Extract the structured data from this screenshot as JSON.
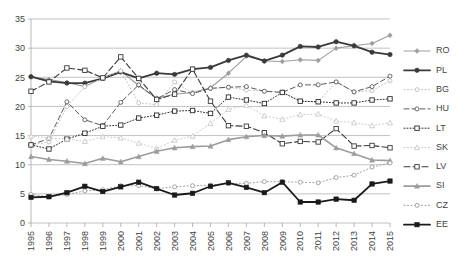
{
  "chart_data": {
    "type": "line",
    "title": "",
    "subtitle": "",
    "xlabel": "",
    "ylabel": "",
    "x": [
      1995,
      1996,
      1997,
      1998,
      1999,
      2000,
      2001,
      2002,
      2003,
      2004,
      2005,
      2006,
      2007,
      2008,
      2009,
      2010,
      2011,
      2012,
      2013,
      2014,
      2015
    ],
    "xlim": [
      1995,
      2015
    ],
    "ylim": [
      0,
      35
    ],
    "yticks": [
      0,
      5,
      10,
      15,
      20,
      25,
      30,
      35
    ],
    "grid": true,
    "legend_position": "right",
    "series": [
      {
        "name": "RO",
        "color": "#9c9c9c",
        "marker": "diamond",
        "dash": "none",
        "width": 1.1,
        "values": [
          25.1,
          24.6,
          24.1,
          23.4,
          24.9,
          26.1,
          23.6,
          21.4,
          22.1,
          22.4,
          23.2,
          25.7,
          28.6,
          27.8,
          27.7,
          28.0,
          27.9,
          30.0,
          30.4,
          30.8,
          32.2
        ]
      },
      {
        "name": "PL",
        "color": "#3a3a3a",
        "marker": "circle-filled",
        "dash": "none",
        "width": 1.8,
        "values": [
          25.1,
          24.3,
          24.0,
          24.0,
          24.8,
          25.9,
          24.8,
          25.7,
          25.5,
          26.4,
          26.7,
          27.9,
          28.8,
          27.8,
          28.8,
          30.3,
          30.2,
          31.1,
          30.4,
          29.3,
          28.9
        ]
      },
      {
        "name": "BG",
        "color": "#bfbfbf",
        "marker": "circle-open",
        "dash": "1,2.5",
        "width": 1.0,
        "values": [
          13.4,
          13.9,
          20.0,
          23.4,
          24.9,
          26.1,
          20.6,
          20.3,
          24.2,
          22.3,
          23.1,
          23.3,
          22.8,
          22.6,
          22.5,
          20.9,
          20.8,
          24.2,
          22.5,
          22.7,
          24.4
        ]
      },
      {
        "name": "HU",
        "color": "#5a5a5a",
        "marker": "circle-open",
        "dash": "5,3",
        "width": 1.0,
        "values": [
          13.4,
          14.5,
          20.8,
          17.7,
          16.7,
          20.7,
          23.7,
          21.3,
          22.9,
          22.2,
          23.1,
          23.3,
          23.4,
          22.6,
          22.4,
          23.7,
          23.7,
          24.2,
          22.5,
          23.4,
          25.2
        ]
      },
      {
        "name": "LT",
        "color": "#2b2b2b",
        "marker": "square-open",
        "dash": "1,2",
        "width": 1.0,
        "values": [
          13.4,
          12.7,
          14.4,
          15.4,
          16.6,
          16.8,
          18.0,
          18.5,
          19.2,
          19.3,
          18.8,
          21.6,
          21.1,
          20.5,
          22.4,
          20.9,
          20.8,
          20.6,
          20.6,
          21.1,
          21.3
        ]
      },
      {
        "name": "SK",
        "color": "#c9c9c9",
        "marker": "triangle-open",
        "dash": "1,2.5",
        "width": 1.0,
        "values": [
          14.9,
          14.6,
          14.4,
          14.0,
          14.8,
          14.6,
          13.7,
          12.8,
          14.2,
          14.9,
          17.1,
          19.5,
          20.2,
          18.4,
          17.8,
          18.6,
          18.7,
          17.5,
          17.2,
          16.7,
          17.2
        ]
      },
      {
        "name": "LV",
        "color": "#3a3a3a",
        "marker": "square-open",
        "dash": "6,3",
        "width": 1.1,
        "values": [
          22.6,
          24.2,
          26.6,
          26.2,
          24.9,
          28.5,
          24.8,
          21.2,
          22.1,
          26.4,
          20.9,
          16.7,
          16.6,
          15.5,
          13.6,
          14.0,
          13.9,
          16.2,
          13.2,
          13.3,
          12.9
        ]
      },
      {
        "name": "SI",
        "color": "#9c9c9c",
        "marker": "triangle-filled",
        "dash": "none",
        "width": 1.6,
        "values": [
          11.4,
          10.9,
          10.6,
          10.2,
          11.1,
          10.5,
          11.4,
          12.3,
          12.9,
          13.1,
          13.2,
          14.3,
          14.8,
          15.0,
          14.9,
          15.1,
          15.1,
          12.9,
          11.9,
          10.8,
          10.7
        ]
      },
      {
        "name": "CZ",
        "color": "#9c9c9c",
        "marker": "circle-open",
        "dash": "1,2.5",
        "width": 1.0,
        "values": [
          4.9,
          4.5,
          4.9,
          5.5,
          5.7,
          6.4,
          6.4,
          5.9,
          6.2,
          6.4,
          6.5,
          6.8,
          6.8,
          7.1,
          7.1,
          7.0,
          6.9,
          7.8,
          8.2,
          9.6,
          10.3
        ]
      },
      {
        "name": "EE",
        "color": "#1a1a1a",
        "marker": "square-filled",
        "dash": "none",
        "width": 1.8,
        "values": [
          4.4,
          4.5,
          5.2,
          6.3,
          5.4,
          6.2,
          7.0,
          5.9,
          4.8,
          5.1,
          6.3,
          6.9,
          6.1,
          5.2,
          7.0,
          3.6,
          3.6,
          4.1,
          3.9,
          6.7,
          7.2
        ]
      }
    ]
  }
}
